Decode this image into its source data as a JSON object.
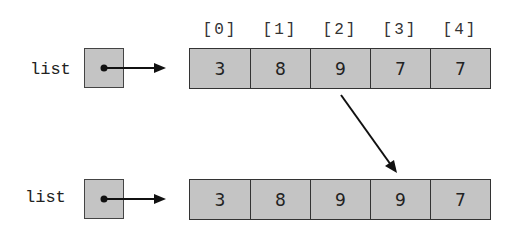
{
  "diagram": {
    "top": {
      "variable_label": "list",
      "indices": [
        "[0]",
        "[1]",
        "[2]",
        "[3]",
        "[4]"
      ],
      "values": [
        "3",
        "8",
        "9",
        "7",
        "7"
      ]
    },
    "bottom": {
      "variable_label": "list",
      "values": [
        "3",
        "8",
        "9",
        "9",
        "7"
      ]
    },
    "copy_arrow": {
      "from_index": 2,
      "to_index": 3
    }
  },
  "colors": {
    "cell_fill": "#c4c4c4",
    "stroke": "#222222",
    "background": "#ffffff"
  }
}
